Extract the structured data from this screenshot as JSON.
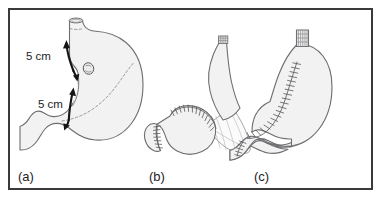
{
  "figure": {
    "border_color": "#3a3a3c",
    "background_color": "#ffffff",
    "organ_fill_color": "#f2f2f2",
    "organ_stroke_color": "#6e6e72",
    "arrow_color": "#141416",
    "suture_color": "#5e5e62",
    "dashed_line_color": "#9a9a9e"
  },
  "panels": [
    {
      "id": "a",
      "label": "(a)",
      "caption": "Stomach with tumour and proximal/distal 5 cm resection margins",
      "annotations": [
        {
          "name": "proximal-margin",
          "text": "5 cm"
        },
        {
          "name": "distal-margin",
          "text": "5 cm"
        }
      ],
      "features": [
        "esophagus",
        "gastric-fundus",
        "gastric-body",
        "lesser-curvature",
        "greater-curvature",
        "pylorus",
        "duodenum",
        "tumour-lesion",
        "resection-dashed-line"
      ]
    },
    {
      "id": "b",
      "label": "(b)",
      "caption": "Gastric remnant with closed staple lines and mobilised jejunal limb on its mesentery",
      "annotations": [],
      "features": [
        "gastric-remnant",
        "duodenal-stump",
        "jejunal-limb",
        "stapled-end",
        "mesentery-fan",
        "mesenteric-vessels",
        "suture-line"
      ]
    },
    {
      "id": "c",
      "label": "(c)",
      "caption": "Completed reconstruction with long anastomotic suture line along the gastric tube",
      "annotations": [],
      "features": [
        "gastric-tube",
        "esophagogastric-anastomosis",
        "long-suture-line",
        "duodenum",
        "pyloric-suture-line"
      ]
    }
  ]
}
